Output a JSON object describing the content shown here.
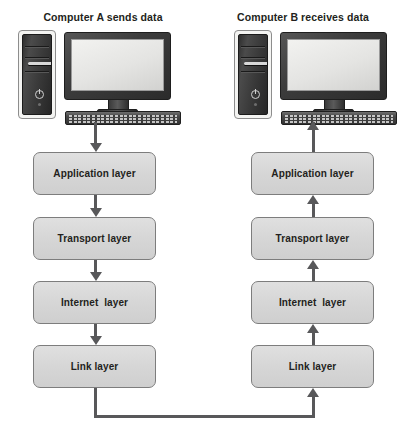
{
  "diagram": {
    "background_color": "#ffffff",
    "box_fill_color": "#d8d8d8",
    "box_border_color": "#7d7d7d",
    "connector_color": "#58585a",
    "text_color": "#231f20"
  },
  "columns": [
    {
      "id": "computer-a",
      "title": "Computer A sends data",
      "direction": "down",
      "device_icons": [
        "computer-tower-icon",
        "computer-monitor-icon",
        "keyboard-icon"
      ],
      "layers": [
        {
          "label": "Application layer"
        },
        {
          "label": "Transport layer"
        },
        {
          "label": "Internet  layer"
        },
        {
          "label": "Link layer"
        }
      ]
    },
    {
      "id": "computer-b",
      "title": "Computer B receives data",
      "direction": "up",
      "device_icons": [
        "computer-tower-icon",
        "computer-monitor-icon",
        "keyboard-icon"
      ],
      "layers": [
        {
          "label": "Application layer"
        },
        {
          "label": "Transport layer"
        },
        {
          "label": "Internet  layer"
        },
        {
          "label": "Link layer"
        }
      ]
    }
  ],
  "network_link": {
    "from": "computer-a-link-layer",
    "to": "computer-b-link-layer",
    "style": "solid-line-with-arrowhead"
  }
}
